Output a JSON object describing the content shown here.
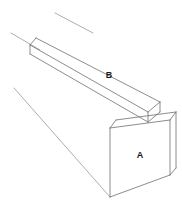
{
  "figure": {
    "background_color": "#ffffff",
    "line_color": "#6e6e6e",
    "label_color": "#1a1a1a",
    "labels": [
      {
        "id": "label-b",
        "text": "B",
        "x": 109,
        "y": 76,
        "describes": "top slab upper face"
      },
      {
        "id": "label-a",
        "text": "A",
        "x": 140,
        "y": 156,
        "describes": "box front face"
      }
    ],
    "solids": [
      {
        "name": "box",
        "front_face_label": "A",
        "vertices": {
          "front_top_left": [
            110,
            128
          ],
          "front_top_right": [
            170,
            120
          ],
          "front_bottom_right": [
            170,
            175
          ],
          "front_bottom_left": [
            110,
            197
          ],
          "back_top_right": [
            176,
            112
          ]
        }
      },
      {
        "name": "slab",
        "top_face_label": "B",
        "vertices": {
          "near_left_top": [
            36,
            38
          ],
          "near_left_bottom": [
            36,
            47
          ],
          "far_top_right": [
            160,
            102
          ],
          "near_bottom_right": [
            124,
            131
          ]
        }
      }
    ],
    "construction_lines": [
      {
        "id": "construction-line-upper",
        "x1": 55,
        "y1": 13,
        "x2": 87,
        "y2": 30
      },
      {
        "id": "construction-line-middle",
        "x1": 11,
        "y1": 33,
        "x2": 40,
        "y2": 50
      },
      {
        "id": "construction-line-lower",
        "x1": 14,
        "y1": 88,
        "x2": 110,
        "y2": 197
      }
    ]
  }
}
